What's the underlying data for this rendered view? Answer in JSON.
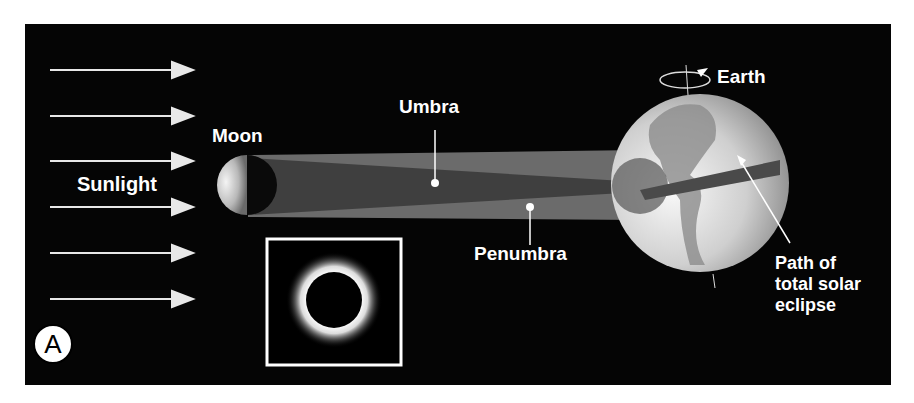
{
  "figure": {
    "panel_label": "A",
    "labels": {
      "sunlight": "Sunlight",
      "moon": "Moon",
      "umbra": "Umbra",
      "penumbra": "Penumbra",
      "earth": "Earth",
      "path_line1": "Path of",
      "path_line2": "total solar",
      "path_line3": "eclipse"
    },
    "sunlight_arrow_count": 6,
    "inset": "total-solar-eclipse-corona-photo"
  },
  "colors": {
    "background": "#050505",
    "text": "#ffffff",
    "penumbra": "#6b6b6b",
    "umbra": "#3f3f3f",
    "page": "#ffffff"
  }
}
